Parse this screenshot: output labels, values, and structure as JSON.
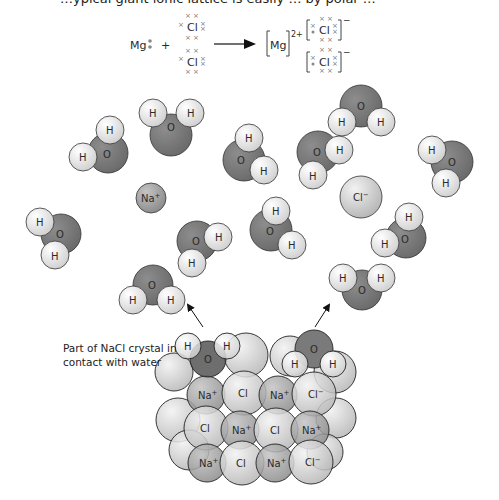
{
  "top_cropped_text": "…ypical giant ionic lattice is easily … by polar …",
  "equation": {
    "reactant_metal": "Mg",
    "plus": "+",
    "chlorine_1": "Cl",
    "chlorine_2": "Cl",
    "product_cation": "Mg",
    "product_cation_charge": "2+",
    "product_anion_1": "Cl",
    "product_anion_2": "Cl",
    "anion_charge": "−",
    "cross": "× ×",
    "cross_single": "×",
    "dot": "•"
  },
  "ions": {
    "sodium": "Na",
    "sodium_charge": "+",
    "chloride": "Cl",
    "chloride_charge": "−"
  },
  "water_labels": {
    "oxygen": "O",
    "hydrogen": "H"
  },
  "caption": {
    "line1": "Part of NaCl crystal in",
    "line2": "contact with water"
  },
  "colors": {
    "oxygen": "#7a7a7a",
    "oxygen_dark": "#5c5c5c",
    "hydrogen": "#ececec",
    "ion_sodium": "#9a9a9a",
    "ion_chloride": "#cfcfcf",
    "outline": "#333333"
  }
}
